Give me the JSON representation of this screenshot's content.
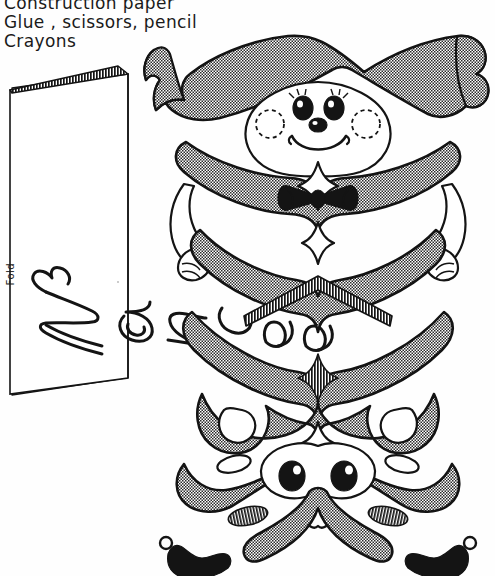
{
  "page": {
    "background_color": "#fefefe",
    "ink_color": "#141414",
    "fill_gray": "#a8a8a8"
  },
  "materials": {
    "heading_visible": false,
    "lines": [
      "Construction paper",
      "Glue , scissors, pencil",
      "Crayons"
    ]
  },
  "card": {
    "name_text": "Nancee",
    "name_orientation": "rotated-vertical",
    "fold_label": "Fold",
    "style": "folded construction paper card with hatched top edge"
  },
  "figure": {
    "name_mirrored": "Nancee",
    "parts": [
      {
        "id": "banner-hat",
        "label": "Banner hat",
        "fill": "gray"
      },
      {
        "id": "upper-face",
        "label": "Upper smiling face",
        "fill": "white"
      },
      {
        "id": "left-arm",
        "label": "Left arm and fist",
        "fill": "white"
      },
      {
        "id": "right-arm",
        "label": "Right arm and fist",
        "fill": "white"
      },
      {
        "id": "bow-tie",
        "label": "Bow tie",
        "fill": "black"
      },
      {
        "id": "diamond-upper",
        "label": "Upper sparkle diamond",
        "fill": "white"
      },
      {
        "id": "diamond-mid",
        "label": "Middle sparkle diamond",
        "fill": "white"
      },
      {
        "id": "chevron-hatch",
        "label": "Hatched chevron",
        "fill": "hatched"
      },
      {
        "id": "diamond-hatch",
        "label": "Hatched diamond",
        "fill": "hatched"
      },
      {
        "id": "diamond-lower",
        "label": "Lower sparkle diamond",
        "fill": "white"
      },
      {
        "id": "lower-face",
        "label": "Lower face",
        "fill": "white"
      },
      {
        "id": "left-shoe",
        "label": "Left shoe",
        "fill": "black"
      },
      {
        "id": "right-shoe",
        "label": "Right shoe",
        "fill": "black"
      }
    ],
    "upper_face": {
      "eyes": 2,
      "eyelashes": true,
      "nose": 1,
      "mouth": "smile",
      "cheeks": "two dashed circles"
    },
    "lower_face": {
      "eyes": 2,
      "nose": 1,
      "mouth": "small smile",
      "cheeks": "two hatched ovals"
    }
  }
}
